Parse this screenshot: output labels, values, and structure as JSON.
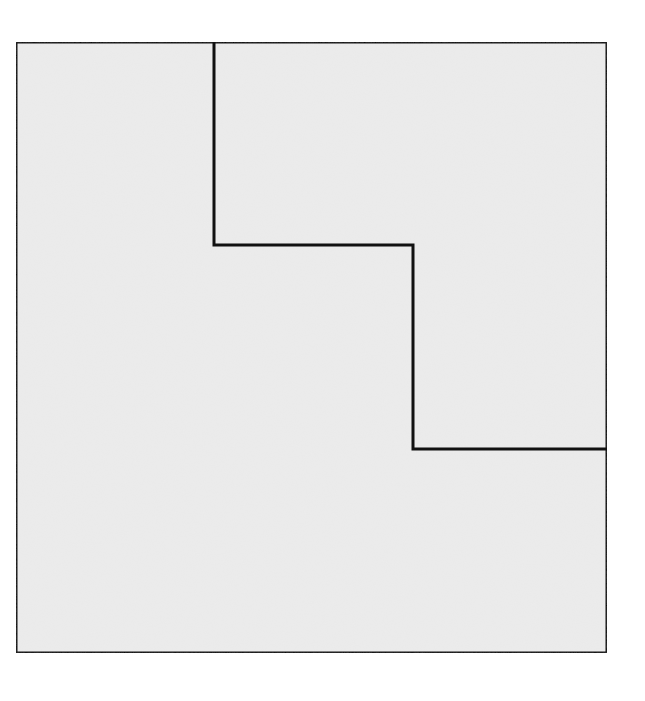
{
  "figure": {
    "fill_color": "#ececec",
    "stroke_color": "#111111",
    "stroke_width": 3,
    "outer_square": {
      "x": 16,
      "y": 42,
      "width": 591,
      "height": 611
    },
    "staircase_path": [
      [
        214,
        42
      ],
      [
        214,
        245
      ],
      [
        413,
        245
      ],
      [
        413,
        449
      ],
      [
        607,
        449
      ]
    ],
    "regions": [
      {
        "name": "upper-right-region",
        "points": [
          [
            214,
            42
          ],
          [
            607,
            42
          ],
          [
            607,
            449
          ],
          [
            413,
            449
          ],
          [
            413,
            245
          ],
          [
            214,
            245
          ]
        ]
      },
      {
        "name": "lower-left-region",
        "points": [
          [
            16,
            42
          ],
          [
            214,
            42
          ],
          [
            214,
            245
          ],
          [
            413,
            245
          ],
          [
            413,
            449
          ],
          [
            607,
            449
          ],
          [
            607,
            653
          ],
          [
            16,
            653
          ]
        ]
      }
    ]
  }
}
